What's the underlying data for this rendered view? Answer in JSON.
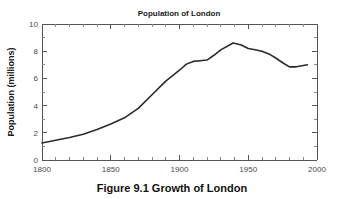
{
  "figure": {
    "caption_label": "Figure 9.1",
    "caption_text": "Growth of London",
    "caption_full": "Figure 9.1    Growth of London",
    "background_color": "#ffffff"
  },
  "chart_data": {
    "type": "line",
    "title": "Population of London",
    "xlabel": "",
    "ylabel": "Population (millions)",
    "xlim": [
      1800,
      2000
    ],
    "ylim": [
      0,
      10
    ],
    "grid": false,
    "legend": "none",
    "line_color": "#2b2b2b",
    "axis_color": "#555555",
    "x_ticks": [
      1800,
      1850,
      1900,
      1950,
      2000
    ],
    "x_tick_labels": [
      "1800",
      "1850",
      "1900",
      "1950",
      "2000"
    ],
    "x_minor_tick_step": 10,
    "y_ticks": [
      0,
      2,
      4,
      6,
      8,
      10
    ],
    "y_tick_labels": [
      "0",
      "2",
      "4",
      "6",
      "8",
      "10"
    ],
    "y_minor_tick_step": 0.5,
    "series": [
      {
        "name": "Population of London",
        "x": [
          1800,
          1810,
          1820,
          1830,
          1840,
          1850,
          1860,
          1870,
          1880,
          1890,
          1900,
          1905,
          1910,
          1915,
          1920,
          1925,
          1930,
          1939,
          1945,
          1950,
          1955,
          1960,
          1965,
          1970,
          1975,
          1980,
          1985,
          1990,
          1993
        ],
        "values": [
          1.25,
          1.45,
          1.65,
          1.9,
          2.25,
          2.65,
          3.1,
          3.8,
          4.8,
          5.8,
          6.6,
          7.05,
          7.25,
          7.3,
          7.35,
          7.7,
          8.1,
          8.6,
          8.45,
          8.2,
          8.1,
          8.0,
          7.8,
          7.5,
          7.15,
          6.85,
          6.85,
          6.95,
          7.0
        ]
      }
    ]
  }
}
